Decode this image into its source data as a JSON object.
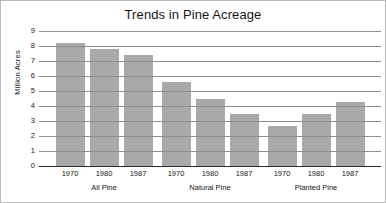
{
  "chart_data": {
    "type": "bar",
    "title": "Trends in Pine Acreage",
    "xlabel": "",
    "ylabel": "Million Acres",
    "ylim": [
      0,
      9
    ],
    "y_ticks": [
      0,
      1,
      2,
      3,
      4,
      5,
      6,
      7,
      8,
      9
    ],
    "grid": true,
    "legend": "none",
    "bar_color": "#a9a9a9",
    "grid_color": "#8c8c8c",
    "axis_color": "#2b2b2b",
    "groups": [
      {
        "label": "All Pine",
        "categories": [
          "1970",
          "1980",
          "1987"
        ],
        "values": [
          8.2,
          7.8,
          7.4
        ]
      },
      {
        "label": "Natural Pine",
        "categories": [
          "1970",
          "1980",
          "1987"
        ],
        "values": [
          5.6,
          4.5,
          3.5
        ]
      },
      {
        "label": "Planted Pine",
        "categories": [
          "1970",
          "1980",
          "1987"
        ],
        "values": [
          2.65,
          3.45,
          4.25
        ]
      }
    ],
    "categories": [
      "1970",
      "1980",
      "1987",
      "1970",
      "1980",
      "1987",
      "1970",
      "1980",
      "1987"
    ],
    "values": [
      8.2,
      7.8,
      7.4,
      5.6,
      4.5,
      3.5,
      2.65,
      3.45,
      4.25
    ]
  }
}
